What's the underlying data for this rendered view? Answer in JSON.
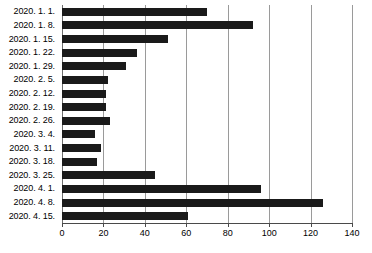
{
  "chart_data": {
    "type": "bar",
    "orientation": "horizontal",
    "title": "",
    "xlabel": "",
    "ylabel": "",
    "xlim": [
      0,
      140
    ],
    "xticks": [
      0,
      20,
      40,
      60,
      80,
      100,
      120,
      140
    ],
    "xtick_labels": [
      "0",
      "20",
      "40",
      "60",
      "80",
      "100",
      "120",
      "140"
    ],
    "grid": true,
    "legend": false,
    "categories": [
      "2020. 1. 1.",
      "2020. 1. 8.",
      "2020. 1. 15.",
      "2020. 1. 22.",
      "2020. 1. 29.",
      "2020. 2. 5.",
      "2020. 2. 12.",
      "2020. 2. 19.",
      "2020. 2. 26.",
      "2020. 3. 4.",
      "2020. 3. 11.",
      "2020. 3. 18.",
      "2020. 3. 25.",
      "2020. 4. 1.",
      "2020. 4. 8.",
      "2020. 4. 15."
    ],
    "values": [
      70,
      92,
      51,
      36,
      31,
      22,
      21,
      21,
      23,
      16,
      19,
      17,
      45,
      96,
      126,
      61
    ],
    "bar_color": "#1a1a1a",
    "grid_color": "#9a9a9a"
  }
}
